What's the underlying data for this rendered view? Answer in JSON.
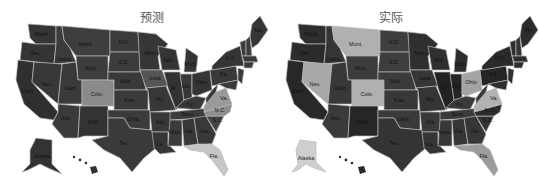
{
  "colors": {
    "dark": "#3a3a3a",
    "darker": "#2e2e2e",
    "medium": "#4a4a4a",
    "gray": "#8a8a8a",
    "light": "#b8b8b8",
    "lighter": "#c9c9c9",
    "border": "#b9b9b9",
    "background": "#ffffff"
  },
  "maps": [
    {
      "title": "预测",
      "highlighted_states": [
        "Colo.",
        "Va.",
        "N.C.",
        "Fla."
      ],
      "labels": {
        "wa": "Wash.",
        "or": "Ore.",
        "ca": "Calif.",
        "id": "Idaho",
        "nv": "Nev.",
        "mt": "Mont.",
        "wy": "Wyo.",
        "ut": "Utah",
        "co": "Colo.",
        "az": "Ariz.",
        "nm": "N.M.",
        "nd": "N.D.",
        "sd": "S.D.",
        "ne": "Neb.",
        "ks": "Kan.",
        "ok": "Okla.",
        "tx": "Tex.",
        "mn": "Minn.",
        "ia": "Iowa",
        "mo": "Mo.",
        "ar": "Ark.",
        "la": "La.",
        "wi": "Wis.",
        "il": "Ill.",
        "mi": "Mich.",
        "in": "Ind.",
        "oh": "Ohio",
        "ky": "Ky.",
        "tn": "Tenn.",
        "ms": "Miss.",
        "al": "Ala.",
        "ga": "Ga.",
        "fl": "Fla.",
        "sc": "S.C.",
        "nc": "N.C.",
        "va": "Va.",
        "wv": "W.V.",
        "pa": "Pa.",
        "ny": "N.Y.",
        "me": "Me.",
        "ak": "Alaska"
      }
    },
    {
      "title": "实际",
      "highlighted_states": [
        "Mont.",
        "Nev.",
        "Colo.",
        "Ohio",
        "Va.",
        "Fla.",
        "Alaska"
      ],
      "labels": {
        "wa": "Wash.",
        "or": "Ore.",
        "ca": "Calif.",
        "id": "Idaho",
        "nv": "Nev.",
        "mt": "Mont.",
        "wy": "Wyo.",
        "ut": "Utah",
        "co": "Colo.",
        "az": "Ariz.",
        "nm": "N.M.",
        "nd": "N.D.",
        "sd": "S.D.",
        "ne": "Neb.",
        "ks": "Kan.",
        "ok": "Okla.",
        "tx": "Tex.",
        "mn": "Minn.",
        "ia": "Iowa",
        "mo": "Mo.",
        "ar": "Ark.",
        "la": "La.",
        "wi": "Wis.",
        "il": "Ill.",
        "mi": "Mich.",
        "in": "Ind.",
        "oh": "Ohio",
        "ky": "Ky.",
        "tn": "Tenn.",
        "ms": "Miss.",
        "al": "Ala.",
        "ga": "Ga.",
        "fl": "Fla.",
        "sc": "S.C.",
        "nc": "N.C.",
        "va": "Va.",
        "wv": "W.V.",
        "pa": "Pa.",
        "ny": "N.Y.",
        "me": "Me.",
        "ak": "Alaska"
      }
    }
  ]
}
